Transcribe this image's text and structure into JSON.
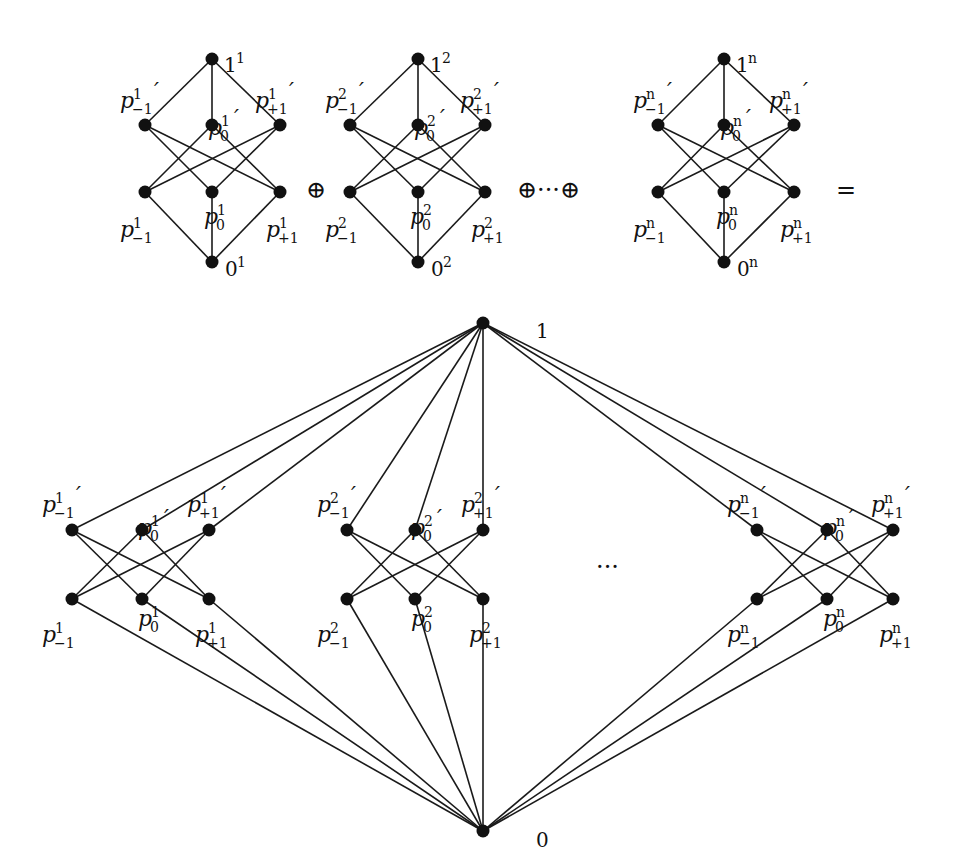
{
  "diagram": {
    "top_row": {
      "operators": {
        "oplus": "⊕",
        "dots_oplus": "⊕···⊕",
        "equals": "="
      },
      "copies": [
        {
          "index": "1",
          "top": "1",
          "bottom": "0"
        },
        {
          "index": "2",
          "top": "1",
          "bottom": "0"
        },
        {
          "index": "n",
          "top": "1",
          "bottom": "0"
        }
      ]
    },
    "bottom": {
      "top_label": "1",
      "bottom_label": "0",
      "ellipsis": "···",
      "groups": [
        {
          "index": "1"
        },
        {
          "index": "2"
        },
        {
          "index": "n"
        }
      ]
    },
    "element_labels": {
      "p": "p",
      "sub_minus": "−1",
      "sub_zero": "0",
      "sub_plus": "+1",
      "prime": "′"
    }
  }
}
